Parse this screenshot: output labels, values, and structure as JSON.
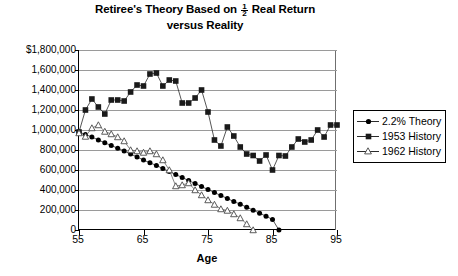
{
  "chart_data": {
    "type": "line",
    "title_line1_pre": "Retiree's Theory Based on",
    "title_fraction_num": "1",
    "title_fraction_den": "2",
    "title_line1_post": "Real Return",
    "title_line2": "versus Reality",
    "xlabel": "Age",
    "ylabel": "",
    "grid": true,
    "legend_position": "right",
    "xlim": [
      55,
      95
    ],
    "ylim": [
      0,
      1800000
    ],
    "xticks": [
      55,
      65,
      75,
      85,
      95
    ],
    "xtick_labels": [
      "55",
      "65",
      "75",
      "85",
      "95"
    ],
    "yticks": [
      0,
      200000,
      400000,
      600000,
      800000,
      1000000,
      1200000,
      1400000,
      1600000,
      1800000
    ],
    "ytick_labels": [
      "0",
      "200,000",
      "400,000",
      "600,000",
      "800,000",
      "1,000,000",
      "1,200,000",
      "1,400,000",
      "1,600,000",
      "$1,800,000"
    ],
    "x": [
      55,
      56,
      57,
      58,
      59,
      60,
      61,
      62,
      63,
      64,
      65,
      66,
      67,
      68,
      69,
      70,
      71,
      72,
      73,
      74,
      75,
      76,
      77,
      78,
      79,
      80,
      81,
      82,
      83,
      84,
      85,
      86,
      87,
      88,
      89,
      90,
      91,
      92,
      93,
      94,
      95
    ],
    "series": [
      {
        "name": "2.2% Theory",
        "marker": "filled-circle",
        "color": "#000000",
        "values": [
          980000,
          955000,
          930000,
          900000,
          872000,
          845000,
          818000,
          790000,
          760000,
          730000,
          700000,
          672000,
          645000,
          615000,
          585000,
          555000,
          525000,
          495000,
          465000,
          435000,
          405000,
          375000,
          345000,
          315000,
          285000,
          258000,
          228000,
          198000,
          168000,
          138000,
          105000,
          0,
          null,
          null,
          null,
          null,
          null,
          null,
          null,
          null,
          null
        ]
      },
      {
        "name": "1953 History",
        "marker": "filled-square",
        "color": "#1a1a1a",
        "values": [
          980000,
          1200000,
          1310000,
          1230000,
          1160000,
          1300000,
          1300000,
          1290000,
          1380000,
          1450000,
          1440000,
          1560000,
          1570000,
          1440000,
          1500000,
          1490000,
          1270000,
          1270000,
          1320000,
          1400000,
          1180000,
          900000,
          840000,
          1030000,
          940000,
          830000,
          760000,
          745000,
          690000,
          750000,
          600000,
          745000,
          740000,
          830000,
          910000,
          880000,
          900000,
          1000000,
          930000,
          1050000,
          1050000
        ]
      },
      {
        "name": "1962 History",
        "marker": "open-triangle",
        "color": "#555555",
        "values": [
          970000,
          935000,
          1020000,
          1050000,
          985000,
          960000,
          930000,
          890000,
          800000,
          790000,
          775000,
          790000,
          760000,
          700000,
          600000,
          440000,
          450000,
          470000,
          400000,
          350000,
          300000,
          255000,
          210000,
          195000,
          160000,
          120000,
          60000,
          0,
          null,
          null,
          null,
          null,
          null,
          null,
          null,
          null,
          null,
          null,
          null,
          null,
          null
        ]
      }
    ],
    "legend": [
      {
        "label": "2.2% Theory",
        "marker": "filled-circle"
      },
      {
        "label": "1953 History",
        "marker": "filled-square"
      },
      {
        "label": "1962 History",
        "marker": "open-triangle"
      }
    ]
  }
}
